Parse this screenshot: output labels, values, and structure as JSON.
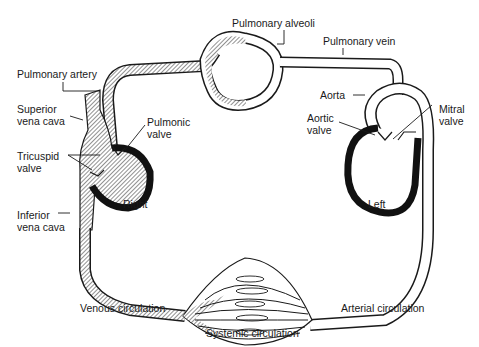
{
  "diagram": {
    "colors": {
      "stroke": "#1a1a1a",
      "venous_hatch": "#555555",
      "background": "#ffffff",
      "muscle_wall": "#111111"
    },
    "labels": {
      "pulmonary_alveoli": "Pulmonary alveoli",
      "pulmonary_vein": "Pulmonary vein",
      "pulmonary_artery": "Pulmonary artery",
      "superior_vena_cava": "Superior\nvena cava",
      "pulmonic_valve": "Pulmonic\nvalve",
      "tricuspid_valve": "Tricuspid\nvalve",
      "aorta": "Aorta",
      "aortic_valve": "Aortic\nvalve",
      "mitral_valve": "Mitral\nvalve",
      "right": "Right",
      "left": "Left",
      "inferior_vena_cava": "Inferior\nvena cava",
      "venous_circulation": "Venous circulation",
      "arterial_circulation": "Arterial circulation",
      "systemic_circulation": "Systemic circulation"
    }
  }
}
